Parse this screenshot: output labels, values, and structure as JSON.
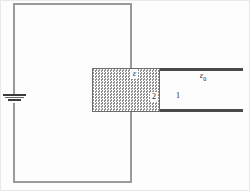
{
  "figure": {
    "colors": {
      "wire": "#9a9a9a",
      "plate": "#4a4a4a",
      "slab_border": "#6d6d6d",
      "slab_fill": "#d8d8d8",
      "text": "#1c1c1c",
      "background": "#fdfdfd"
    }
  },
  "labels": {
    "dielectric_permittivity": "ε",
    "vacuum_permittivity": "ε",
    "vacuum_permittivity_subscript": "0",
    "region_dielectric": "2",
    "region_vacuum": "1"
  },
  "elements": {
    "battery": "battery-symbol",
    "dielectric_slab": "dielectric-slab",
    "top_plate": "capacitor-top-plate",
    "bottom_plate": "capacitor-bottom-plate",
    "circuit": "circuit-loop"
  }
}
